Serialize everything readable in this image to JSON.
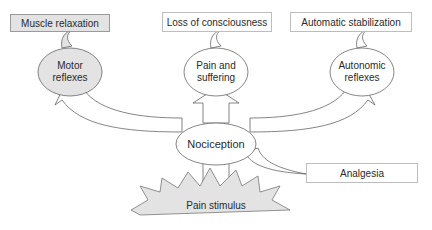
{
  "top_boxes": {
    "left": "Muscle relaxation",
    "center": "Loss of consciousness",
    "right": "Automatic stabilization"
  },
  "bubbles": {
    "left_line1": "Motor",
    "left_line2": "reflexes",
    "center_line1": "Pain and",
    "center_line2": "suffering",
    "right_line1": "Autonomic",
    "right_line2": "reflexes"
  },
  "center": "Nociception",
  "side_box": "Analgesia",
  "bottom": "Pain stimulus",
  "colors": {
    "gray_fill": "#e3e3e3",
    "stroke": "#555555"
  }
}
